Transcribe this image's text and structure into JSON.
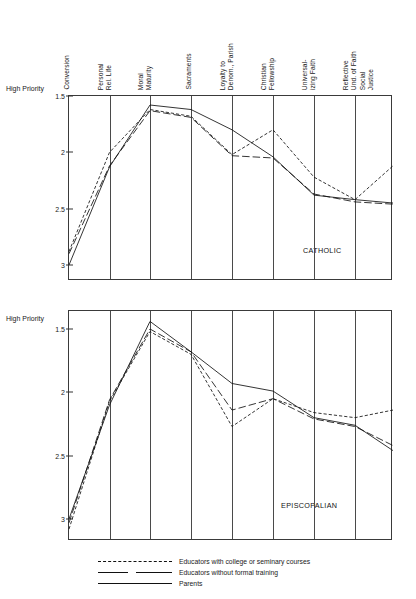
{
  "figure": {
    "axis_label": {
      "line1": "High",
      "line2": "Priority"
    },
    "y_ticks": [
      "1.5",
      "2",
      "2.5",
      "3"
    ],
    "y_tick_values": [
      1.5,
      2,
      2.5,
      3
    ],
    "categories": [
      {
        "line1": "Conversion",
        "line2": ""
      },
      {
        "line1": "Personal",
        "line2": "Rel. Life"
      },
      {
        "line1": "Moral",
        "line2": "Maturity"
      },
      {
        "line1": "Sacraments",
        "line2": ""
      },
      {
        "line1": "Loyalty to",
        "line2": "Denom., Parish"
      },
      {
        "line1": "Christian",
        "line2": "Fellowship"
      },
      {
        "line1": "Universal-",
        "line2": "izing Faith"
      },
      {
        "line1": "Reflective",
        "line2": "Und. of Faith"
      },
      {
        "line1": "Social",
        "line2": "Justice"
      }
    ],
    "panels": [
      {
        "name": "CATHOLIC"
      },
      {
        "name": "EPISCOPALIAN"
      }
    ],
    "legend": [
      {
        "key": "dashed",
        "label": "Educators with college or seminary courses"
      },
      {
        "key": "long-dash",
        "label": "Educators without formal training"
      },
      {
        "key": "solid",
        "label": "Parents"
      }
    ]
  },
  "chart_data": [
    {
      "type": "line",
      "title": "CATHOLIC",
      "xlabel": "",
      "ylabel": "High Priority",
      "ylim": [
        1.5,
        3.05
      ],
      "y_inverted": true,
      "grid": true,
      "legend_position": "below-figure",
      "categories": [
        "Conversion",
        "Personal Rel. Life",
        "Moral Maturity",
        "Sacraments",
        "Loyalty to Denom., Parish",
        "Christian Fellowship",
        "Universalizing Faith",
        "Reflective Und. of Faith",
        "Social Justice"
      ],
      "series": [
        {
          "name": "Educators with college or seminary courses",
          "style": "dashed",
          "values": [
            2.88,
            2.0,
            1.62,
            1.68,
            2.02,
            1.8,
            2.22,
            2.42,
            2.12
          ]
        },
        {
          "name": "Educators without formal training",
          "style": "long-dash",
          "values": [
            2.9,
            2.12,
            1.63,
            1.69,
            2.03,
            2.05,
            2.37,
            2.44,
            2.46
          ]
        },
        {
          "name": "Parents",
          "style": "solid",
          "values": [
            3.0,
            2.13,
            1.58,
            1.62,
            1.8,
            2.04,
            2.38,
            2.42,
            2.45
          ]
        }
      ]
    },
    {
      "type": "line",
      "title": "EPISCOPALIAN",
      "xlabel": "",
      "ylabel": "High Priority",
      "ylim": [
        1.45,
        3.1
      ],
      "y_inverted": true,
      "grid": true,
      "legend_position": "below-figure",
      "categories": [
        "Conversion",
        "Personal Rel. Life",
        "Moral Maturity",
        "Sacraments",
        "Loyalty to Denom., Parish",
        "Christian Fellowship",
        "Universalizing Faith",
        "Reflective Und. of Faith",
        "Social Justice"
      ],
      "series": [
        {
          "name": "Educators with college or seminary courses",
          "style": "dashed",
          "values": [
            3.08,
            2.07,
            1.52,
            1.7,
            2.27,
            2.05,
            2.16,
            2.2,
            2.14
          ]
        },
        {
          "name": "Educators without formal training",
          "style": "long-dash",
          "values": [
            3.03,
            2.06,
            1.5,
            1.68,
            2.14,
            2.05,
            2.21,
            2.27,
            2.42
          ]
        },
        {
          "name": "Parents",
          "style": "solid",
          "values": [
            3.0,
            2.1,
            1.44,
            1.68,
            1.93,
            1.99,
            2.2,
            2.26,
            2.46
          ]
        }
      ]
    }
  ]
}
